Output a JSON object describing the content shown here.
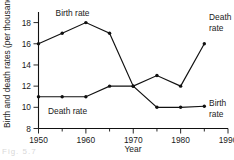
{
  "chart_data": {
    "type": "line",
    "title": "",
    "xlabel": "Year",
    "ylabel": "Birth and death rates (per thousand)",
    "xlim": [
      1950,
      1990
    ],
    "ylim": [
      8,
      19
    ],
    "grid": false,
    "legend_position": "inline-annotations",
    "x": [
      1950,
      1955,
      1960,
      1965,
      1970,
      1975,
      1980,
      1985
    ],
    "xticks": [
      1950,
      1960,
      1970,
      1980,
      1990
    ],
    "xtick_labels": [
      "1950",
      "1960",
      "1970",
      "1980",
      "1990"
    ],
    "xminor_ticks": [
      1955,
      1965,
      1975,
      1985
    ],
    "yticks": [
      8,
      10,
      12,
      14,
      16,
      18
    ],
    "ytick_labels": [
      "8",
      "10",
      "12",
      "14",
      "16",
      "18"
    ],
    "series": [
      {
        "name": "Birth rate",
        "values": [
          16,
          17,
          18,
          17,
          12,
          10,
          10,
          10.1
        ]
      },
      {
        "name": "Death rate",
        "values": [
          11,
          11,
          11,
          12,
          12,
          13,
          12,
          16
        ]
      }
    ],
    "annotations": [
      {
        "id": "birth-top",
        "text": "Birth rate",
        "x": 1953.6,
        "y": 18.9
      },
      {
        "id": "death-inline",
        "text": "Death rate",
        "x": 1952.0,
        "y": 9.65
      },
      {
        "id": "death-right-line1",
        "text": "Death",
        "x": 1986.0,
        "y": 18.5
      },
      {
        "id": "death-right-line2",
        "text": "rate",
        "x": 1986.0,
        "y": 17.45
      },
      {
        "id": "birth-right-line1",
        "text": "Birth",
        "x": 1986.0,
        "y": 10.45
      },
      {
        "id": "birth-right-line2",
        "text": "rate",
        "x": 1986.0,
        "y": 9.4
      }
    ],
    "caption_fragment": "Fig. 5.7"
  }
}
